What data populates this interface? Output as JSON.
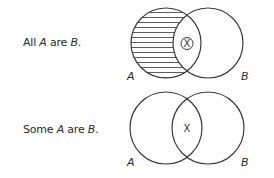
{
  "diagrams": [
    {
      "statement": {
        "prefix": "All ",
        "term_a": "A",
        "middle": " are ",
        "term_b": "B",
        "suffix": "."
      },
      "label_a": "A",
      "label_b": "B",
      "intersection_mark": "X",
      "intersection_mark_circled": true,
      "shaded_region": "A only (A minus B)",
      "shading_style": "horizontal-lines"
    },
    {
      "statement": {
        "prefix": "Some ",
        "term_a": "A",
        "middle": " are ",
        "term_b": "B",
        "suffix": "."
      },
      "label_a": "A",
      "label_b": "B",
      "intersection_mark": "X",
      "intersection_mark_circled": false,
      "shaded_region": "none",
      "shading_style": "none"
    }
  ],
  "colors": {
    "stroke": "#3a3a3a",
    "text": "#2b2b2b",
    "background": "#ffffff"
  }
}
